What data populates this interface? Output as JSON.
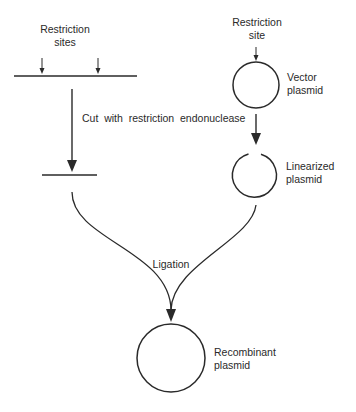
{
  "diagram": {
    "insert_dna": {
      "label_line1": "Restriction",
      "label_line2": "sites"
    },
    "vector": {
      "site_label_line1": "Restriction",
      "site_label_line2": "site",
      "label_line1": "Vector",
      "label_line2": "plasmid"
    },
    "cut_step": {
      "label": "Cut  with  restriction  endonuclease"
    },
    "linearized": {
      "label_line1": "Linearized",
      "label_line2": "plasmid"
    },
    "ligation_step": {
      "label": "Ligation"
    },
    "recombinant": {
      "label_line1": "Recombinant",
      "label_line2": "plasmid"
    },
    "colors": {
      "stroke": "#2a2a2a",
      "background": "#ffffff"
    }
  }
}
